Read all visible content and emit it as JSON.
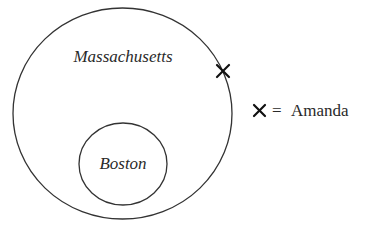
{
  "diagram": {
    "type": "nested-sets",
    "outer_set": {
      "label": "Massachusetts"
    },
    "inner_set": {
      "label": "Boston"
    },
    "marker": {
      "symbol": "×",
      "position": "on boundary of Massachusetts circle, upper right"
    },
    "legend": {
      "symbol": "×",
      "equals": "=",
      "label": "Amanda"
    }
  },
  "colors": {
    "line": "#333333",
    "text": "#2a2a2a",
    "background": "#ffffff"
  }
}
